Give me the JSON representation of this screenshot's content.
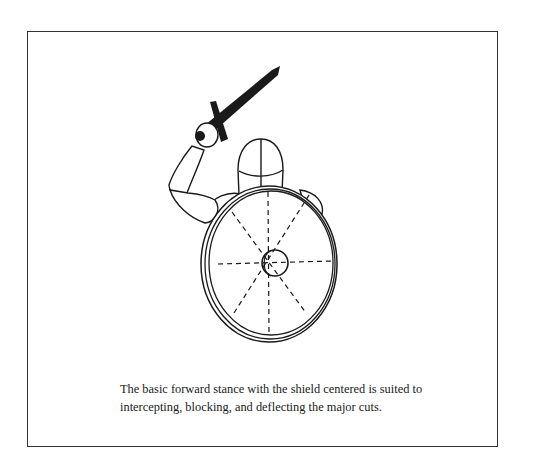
{
  "figure": {
    "colors": {
      "line": "#1a1a1a",
      "fill": "#ffffff",
      "frame": "#333333"
    }
  },
  "caption": {
    "line1": "The basic forward stance with the shield centered is suited to",
    "line2": "intercepting, blocking, and deflecting the major cuts."
  }
}
